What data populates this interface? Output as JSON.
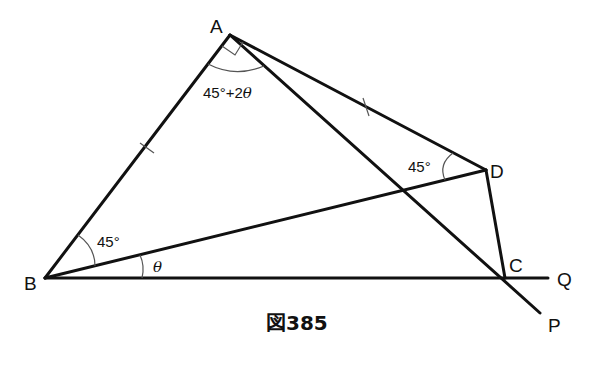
{
  "figure": {
    "caption": "図385",
    "points": {
      "A": {
        "label": "A",
        "x": 230,
        "y": 35
      },
      "B": {
        "label": "B",
        "x": 45,
        "y": 278
      },
      "C": {
        "label": "C",
        "x": 505,
        "y": 278
      },
      "D": {
        "label": "D",
        "x": 486,
        "y": 170
      },
      "Q": {
        "label": "Q",
        "x": 548,
        "y": 278
      },
      "P": {
        "label": "P",
        "x": 540,
        "y": 313
      }
    },
    "angles": {
      "at_A": "45°+2θ",
      "at_A_part1": "45°+2",
      "at_A_part2": "θ",
      "at_D": "45°",
      "at_B_upper": "45°",
      "at_B_lower": "θ"
    },
    "marks": {
      "right_angle_at": "A",
      "equal_ticks": [
        "AB",
        "AD"
      ]
    },
    "colors": {
      "line": "#111111",
      "arc": "#555555",
      "background": "#ffffff"
    }
  }
}
